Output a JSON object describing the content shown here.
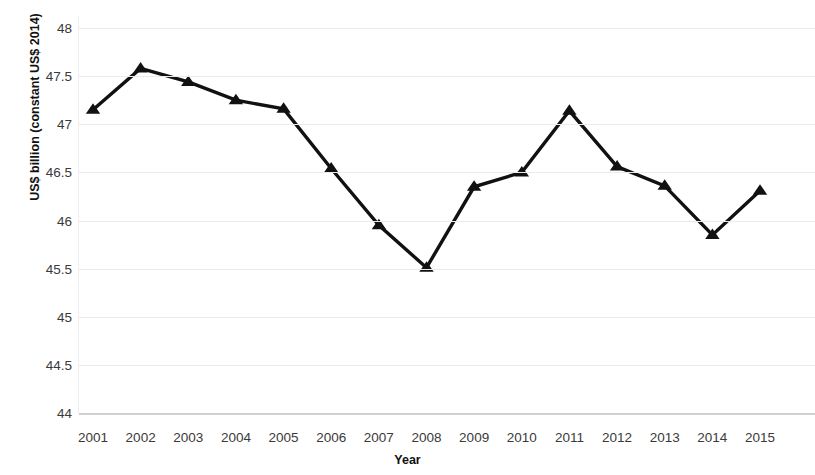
{
  "chart_data": {
    "type": "line",
    "title": "",
    "xlabel": "Year",
    "ylabel": "US$ billion (constant US$ 2014)",
    "categories": [
      "2001",
      "2002",
      "2003",
      "2004",
      "2005",
      "2006",
      "2007",
      "2008",
      "2009",
      "2010",
      "2011",
      "2012",
      "2013",
      "2014",
      "2015"
    ],
    "values": [
      47.15,
      47.58,
      47.44,
      47.25,
      47.16,
      46.54,
      45.95,
      45.51,
      46.35,
      46.5,
      47.14,
      46.56,
      46.36,
      45.85,
      46.31
    ],
    "series": [
      {
        "name": "US$ billion (constant US$ 2014)",
        "values": [
          47.15,
          47.58,
          47.44,
          47.25,
          47.16,
          46.54,
          45.95,
          45.51,
          46.35,
          46.5,
          47.14,
          46.56,
          46.36,
          45.85,
          46.31
        ]
      }
    ],
    "ylim": [
      44,
      48
    ],
    "ytick_labels": [
      "48",
      "47.5",
      "47",
      "46.5",
      "46",
      "45.5",
      "45",
      "44.5",
      "44"
    ],
    "ytick_values": [
      48,
      47.5,
      47,
      46.5,
      46,
      45.5,
      45,
      44.5,
      44
    ],
    "grid": true,
    "legend": "none",
    "marker": "triangle",
    "line_color": "#111111",
    "marker_color": "#111111",
    "grid_color": "#ECEAEA",
    "background": "#FFFFFF"
  },
  "axes": {
    "y_title": "US$ billion (constant US$ 2014)",
    "x_title": "Year"
  }
}
